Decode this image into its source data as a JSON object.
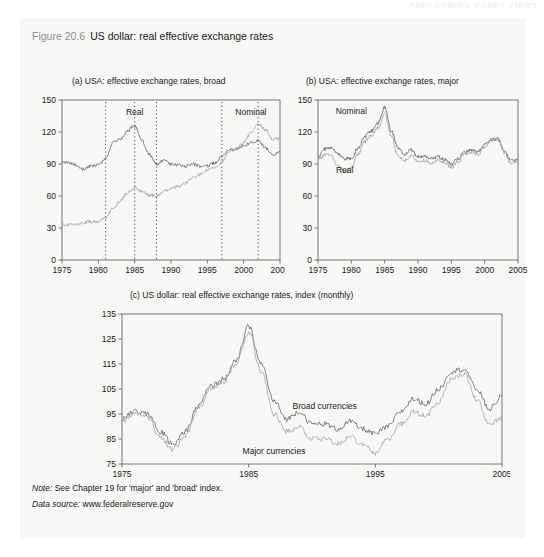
{
  "running_head": "PERFORMING FOREX FIRMS",
  "figure": {
    "number": "Figure 20.6",
    "title": "US dollar: real effective exchange rates"
  },
  "notes": {
    "note_label": "Note:",
    "note_text": "See Chapter 19 for 'major' and 'broad' index.",
    "source_label": "Data source:",
    "source_text": "www.federalreserve.gov"
  },
  "colors": {
    "panel_background": "#f7f7f5",
    "axis": "#555555",
    "series_dark": "#6d6d6d",
    "series_light": "#a9a9a9",
    "text": "#1a1a1a",
    "fignum": "#8d8d8d"
  },
  "chart_data": [
    {
      "id": "a",
      "type": "line",
      "title": "(a)   USA: effective exchange rates, broad",
      "xlabel": "",
      "ylabel": "",
      "xlim": [
        1975,
        2005
      ],
      "ylim": [
        0,
        150
      ],
      "yticks": [
        0,
        30,
        60,
        90,
        120,
        150
      ],
      "xticks": [
        1975,
        1980,
        1985,
        1990,
        1995,
        2000,
        2005
      ],
      "grid": false,
      "legend": "inline-annotations",
      "annotations": [
        {
          "text": "Real",
          "x": 1985,
          "y": 136
        },
        {
          "text": "Nominal",
          "x": 2001,
          "y": 136
        }
      ],
      "vlines": [
        1981,
        1985,
        1988,
        1997,
        2002
      ],
      "series": [
        {
          "name": "Real",
          "color": "#6d6d6d",
          "x": [
            1975,
            1976,
            1977,
            1978,
            1979,
            1980,
            1981,
            1982,
            1983,
            1984,
            1985,
            1986,
            1987,
            1988,
            1989,
            1990,
            1991,
            1992,
            1993,
            1994,
            1995,
            1996,
            1997,
            1998,
            1999,
            2000,
            2001,
            2002,
            2003,
            2004,
            2005
          ],
          "values": [
            92,
            91,
            89,
            85,
            88,
            89,
            95,
            110,
            113,
            121,
            126,
            112,
            99,
            90,
            93,
            90,
            89,
            88,
            90,
            88,
            88,
            91,
            97,
            103,
            104,
            107,
            110,
            112,
            105,
            99,
            101
          ]
        },
        {
          "name": "Nominal",
          "color": "#a9a9a9",
          "x": [
            1975,
            1976,
            1977,
            1978,
            1979,
            1980,
            1981,
            1982,
            1983,
            1984,
            1985,
            1986,
            1987,
            1988,
            1989,
            1990,
            1991,
            1992,
            1993,
            1994,
            1995,
            1996,
            1997,
            1998,
            1999,
            2000,
            2001,
            2002,
            2003,
            2004,
            2005
          ],
          "values": [
            33,
            33,
            33,
            35,
            36,
            36,
            39,
            48,
            55,
            63,
            68,
            64,
            61,
            60,
            64,
            67,
            69,
            72,
            77,
            80,
            84,
            87,
            92,
            101,
            104,
            110,
            119,
            127,
            122,
            113,
            114
          ]
        }
      ]
    },
    {
      "id": "b",
      "type": "line",
      "title": "(b)   USA: effective exchange rates, major",
      "xlabel": "",
      "ylabel": "",
      "xlim": [
        1975,
        2005
      ],
      "ylim": [
        0,
        150
      ],
      "yticks": [
        0,
        30,
        60,
        90,
        120,
        150
      ],
      "xticks": [
        1975,
        1980,
        1985,
        1990,
        1995,
        2000,
        2005
      ],
      "grid": false,
      "legend": "inline-annotations",
      "annotations": [
        {
          "text": "Nominal",
          "x": 1980,
          "y": 137
        },
        {
          "text": "Real",
          "x": 1979,
          "y": 82
        }
      ],
      "vlines": [],
      "series": [
        {
          "name": "Nominal",
          "color": "#6d6d6d",
          "x": [
            1975,
            1976,
            1977,
            1978,
            1979,
            1980,
            1981,
            1982,
            1983,
            1984,
            1985,
            1986,
            1987,
            1988,
            1989,
            1990,
            1991,
            1992,
            1993,
            1994,
            1995,
            1996,
            1997,
            1998,
            1999,
            2000,
            2001,
            2002,
            2003,
            2004,
            2005
          ],
          "values": [
            97,
            104,
            105,
            99,
            95,
            95,
            105,
            116,
            121,
            128,
            143,
            121,
            105,
            99,
            103,
            97,
            97,
            95,
            97,
            94,
            90,
            95,
            101,
            103,
            101,
            108,
            113,
            113,
            101,
            93,
            94
          ]
        },
        {
          "name": "Real",
          "color": "#a9a9a9",
          "x": [
            1975,
            1976,
            1977,
            1978,
            1979,
            1980,
            1981,
            1982,
            1983,
            1984,
            1985,
            1986,
            1987,
            1988,
            1989,
            1990,
            1991,
            1992,
            1993,
            1994,
            1995,
            1996,
            1997,
            1998,
            1999,
            2000,
            2001,
            2002,
            2003,
            2004,
            2005
          ],
          "values": [
            94,
            99,
            98,
            88,
            83,
            86,
            99,
            111,
            117,
            124,
            137,
            116,
            98,
            93,
            98,
            93,
            93,
            91,
            94,
            91,
            87,
            92,
            99,
            101,
            99,
            106,
            113,
            114,
            100,
            90,
            93
          ]
        }
      ]
    },
    {
      "id": "c",
      "type": "line",
      "title": "(c)      US dollar: real effective exchange rates, index (monthly)",
      "xlabel": "",
      "ylabel": "",
      "xlim": [
        1975,
        2005
      ],
      "ylim": [
        75,
        135
      ],
      "yticks": [
        75,
        85,
        95,
        105,
        115,
        125,
        135
      ],
      "xticks": [
        1975,
        1985,
        1995,
        2005
      ],
      "grid": false,
      "legend": "inline-annotations",
      "annotations": [
        {
          "text": "Broad currencies",
          "x": 1991,
          "y": 97
        },
        {
          "text": "Major currencies",
          "x": 1987,
          "y": 79
        }
      ],
      "vlines": [],
      "series": [
        {
          "name": "Broad currencies",
          "color": "#6d6d6d",
          "x": [
            1975,
            1976,
            1977,
            1978,
            1979,
            1980,
            1981,
            1982,
            1983,
            1984,
            1985,
            1986,
            1987,
            1988,
            1989,
            1990,
            1991,
            1992,
            1993,
            1994,
            1995,
            1996,
            1997,
            1998,
            1999,
            2000,
            2001,
            2002,
            2003,
            2004,
            2005
          ],
          "values": [
            93,
            96,
            95,
            88,
            83,
            88,
            98,
            106,
            109,
            116,
            130,
            115,
            100,
            93,
            96,
            91,
            91,
            89,
            92,
            89,
            87,
            90,
            96,
            101,
            99,
            105,
            112,
            113,
            105,
            97,
            102
          ]
        },
        {
          "name": "Major currencies",
          "color": "#a9a9a9",
          "x": [
            1975,
            1976,
            1977,
            1978,
            1979,
            1980,
            1981,
            1982,
            1983,
            1984,
            1985,
            1986,
            1987,
            1988,
            1989,
            1990,
            1991,
            1992,
            1993,
            1994,
            1995,
            1996,
            1997,
            1998,
            1999,
            2000,
            2001,
            2002,
            2003,
            2004,
            2005
          ],
          "values": [
            92,
            95,
            94,
            86,
            81,
            86,
            97,
            105,
            108,
            115,
            128,
            112,
            95,
            88,
            90,
            85,
            85,
            83,
            86,
            83,
            79,
            85,
            91,
            96,
            94,
            100,
            109,
            111,
            101,
            91,
            93
          ]
        }
      ]
    }
  ]
}
